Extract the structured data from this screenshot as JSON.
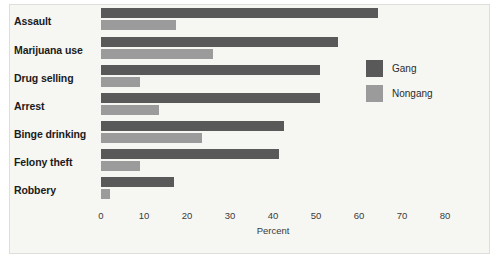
{
  "chart_data": {
    "type": "bar",
    "orientation": "horizontal",
    "title": "",
    "xlabel": "Percent",
    "ylabel": "",
    "xlim": [
      0,
      80
    ],
    "xticks": [
      0,
      10,
      20,
      30,
      40,
      50,
      60,
      70,
      80
    ],
    "grid": false,
    "legend_position": "right",
    "categories": [
      "Assault",
      "Marijuana use",
      "Drug selling",
      "Arrest",
      "Binge drinking",
      "Felony theft",
      "Robbery"
    ],
    "series": [
      {
        "name": "Gang",
        "color": "#595959",
        "values": [
          64.5,
          55,
          51,
          51,
          42.5,
          41.5,
          17
        ]
      },
      {
        "name": "Nongang",
        "color": "#9b9b9b",
        "values": [
          17.5,
          26,
          9,
          13.5,
          23.5,
          9,
          2
        ]
      }
    ]
  },
  "legend": {
    "items": [
      {
        "label": "Gang",
        "color": "#595959"
      },
      {
        "label": "Nongang",
        "color": "#9b9b9b"
      }
    ]
  },
  "colors": {
    "gang": "#595959",
    "nongang": "#9b9b9b",
    "plot_background": "#f6f6f3",
    "text": "#1b1b1b"
  }
}
